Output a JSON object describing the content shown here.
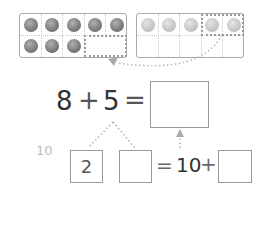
{
  "ten_frames": [
    {
      "id": "left",
      "filled": 8,
      "shade": "dark",
      "highlight_cells": [
        8,
        9
      ]
    },
    {
      "id": "right",
      "filled": 5,
      "shade": "light",
      "highlight_cells": [
        3,
        4
      ]
    }
  ],
  "equation": {
    "a": "8",
    "op": "+",
    "b": "5",
    "eq": "=",
    "answer": ""
  },
  "decompose": {
    "ten_label": "10",
    "part1": "2",
    "part2": "",
    "eq": "=",
    "ten": "10",
    "plus": "+",
    "result": ""
  },
  "colors": {
    "counter_dark": "#7a7a7a",
    "counter_light": "#c4c4c4",
    "border": "#999999",
    "text": "#333333"
  }
}
